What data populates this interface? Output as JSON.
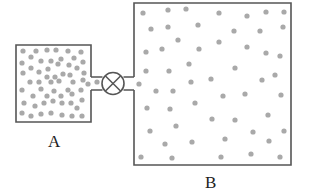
{
  "diagram": {
    "colors": {
      "outline": "#555555",
      "particle": "#a9a9a9",
      "background": "#ffffff"
    },
    "containers": [
      {
        "id": "A",
        "label": "A",
        "state": "filled with gas (dense)"
      },
      {
        "id": "B",
        "label": "B",
        "state": "filled with gas (sparse)"
      }
    ],
    "valve": {
      "icon": "valve-icon",
      "symbol": "circle with X"
    },
    "particles_A": [
      [
        23,
        51
      ],
      [
        36,
        51
      ],
      [
        47,
        50
      ],
      [
        56,
        50
      ],
      [
        68,
        51
      ],
      [
        81,
        52
      ],
      [
        31,
        57
      ],
      [
        22,
        63
      ],
      [
        41,
        61
      ],
      [
        51,
        61
      ],
      [
        61,
        59
      ],
      [
        74,
        58
      ],
      [
        83,
        62
      ],
      [
        31,
        68
      ],
      [
        48,
        69
      ],
      [
        58,
        64
      ],
      [
        69,
        65
      ],
      [
        77,
        68
      ],
      [
        23,
        73
      ],
      [
        39,
        72
      ],
      [
        63,
        74
      ],
      [
        84,
        73
      ],
      [
        47,
        77
      ],
      [
        55,
        77
      ],
      [
        70,
        75
      ],
      [
        30,
        82
      ],
      [
        39,
        82
      ],
      [
        51,
        82
      ],
      [
        59,
        81
      ],
      [
        73,
        82
      ],
      [
        83,
        80
      ],
      [
        88,
        84
      ],
      [
        97,
        82
      ],
      [
        22,
        90
      ],
      [
        41,
        89
      ],
      [
        54,
        91
      ],
      [
        68,
        90
      ],
      [
        81,
        90
      ],
      [
        33,
        96
      ],
      [
        47,
        96
      ],
      [
        61,
        96
      ],
      [
        72,
        94
      ],
      [
        24,
        103
      ],
      [
        35,
        106
      ],
      [
        44,
        103
      ],
      [
        53,
        101
      ],
      [
        62,
        103
      ],
      [
        71,
        103
      ],
      [
        82,
        100
      ],
      [
        22,
        113
      ],
      [
        31,
        116
      ],
      [
        41,
        114
      ],
      [
        51,
        113
      ],
      [
        62,
        115
      ],
      [
        72,
        116
      ],
      [
        82,
        116
      ],
      [
        77,
        108
      ]
    ],
    "particles_B": [
      [
        143,
        13
      ],
      [
        168,
        10
      ],
      [
        186,
        9
      ],
      [
        219,
        13
      ],
      [
        247,
        16
      ],
      [
        266,
        12
      ],
      [
        284,
        12
      ],
      [
        151,
        29
      ],
      [
        168,
        27
      ],
      [
        198,
        25
      ],
      [
        234,
        31
      ],
      [
        260,
        31
      ],
      [
        283,
        27
      ],
      [
        178,
        40
      ],
      [
        219,
        42
      ],
      [
        146,
        52
      ],
      [
        162,
        49
      ],
      [
        199,
        49
      ],
      [
        247,
        47
      ],
      [
        266,
        53
      ],
      [
        280,
        56
      ],
      [
        189,
        64
      ],
      [
        146,
        71
      ],
      [
        169,
        71
      ],
      [
        235,
        68
      ],
      [
        275,
        75
      ],
      [
        139,
        84
      ],
      [
        191,
        82
      ],
      [
        211,
        79
      ],
      [
        262,
        80
      ],
      [
        156,
        91
      ],
      [
        173,
        91
      ],
      [
        223,
        96
      ],
      [
        245,
        94
      ],
      [
        281,
        95
      ],
      [
        147,
        108
      ],
      [
        170,
        109
      ],
      [
        195,
        103
      ],
      [
        212,
        119
      ],
      [
        235,
        120
      ],
      [
        268,
        115
      ],
      [
        150,
        131
      ],
      [
        176,
        126
      ],
      [
        253,
        132
      ],
      [
        284,
        131
      ],
      [
        165,
        144
      ],
      [
        192,
        142
      ],
      [
        225,
        139
      ],
      [
        269,
        141
      ],
      [
        141,
        157
      ],
      [
        172,
        158
      ],
      [
        221,
        157
      ],
      [
        251,
        154
      ],
      [
        280,
        157
      ]
    ]
  }
}
